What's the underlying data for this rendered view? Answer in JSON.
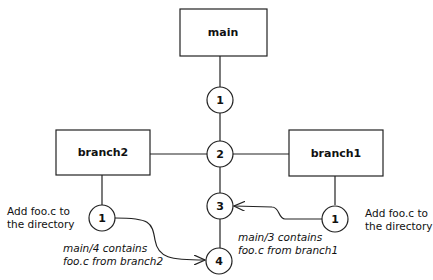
{
  "diagram": {
    "boxes": {
      "main": "main",
      "branch2": "branch2",
      "branch1": "branch1"
    },
    "nodes": {
      "main_1": "1",
      "main_2": "2",
      "main_3": "3",
      "main_4": "4",
      "branch2_1": "1",
      "branch1_1": "1"
    },
    "notes": {
      "left_add": [
        "Add foo.c to",
        "the directory"
      ],
      "right_add": [
        "Add foo.c to",
        "the directory"
      ],
      "merge_branch2": [
        "main/4 contains",
        "foo.c from branch2"
      ],
      "merge_branch1": [
        "main/3 contains",
        "foo.c from branch1"
      ]
    },
    "colors": {
      "stroke": "#222222",
      "background": "#ffffff"
    }
  }
}
